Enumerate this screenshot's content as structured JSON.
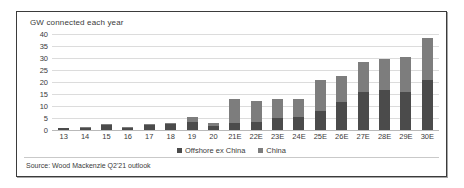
{
  "chart_data": {
    "type": "bar",
    "stacked": true,
    "title": "GW connected each year",
    "xlabel": "",
    "ylabel": "",
    "ylim": [
      0,
      40
    ],
    "yticks": [
      40,
      35,
      30,
      25,
      20,
      15,
      10,
      5,
      0
    ],
    "grid": true,
    "legend_position": "bottom-center",
    "categories": [
      "13",
      "14",
      "15",
      "16",
      "17",
      "18",
      "19",
      "20",
      "21E",
      "22E",
      "23E",
      "24E",
      "25E",
      "26E",
      "27E",
      "28E",
      "29E",
      "30E"
    ],
    "series": [
      {
        "name": "Offshore ex China",
        "color": "#4b4b4b",
        "values": [
          0.8,
          0.9,
          2.0,
          1.0,
          2.1,
          2.5,
          3.3,
          1.8,
          3.0,
          3.2,
          5.2,
          5.4,
          8.0,
          11.5,
          16.0,
          16.5,
          16.0,
          21.0
        ]
      },
      {
        "name": "China",
        "color": "#7d7d7d",
        "values": [
          0.2,
          0.2,
          0.4,
          0.2,
          0.3,
          0.6,
          2.0,
          1.0,
          10.0,
          8.8,
          7.8,
          7.6,
          13.0,
          11.0,
          12.5,
          13.0,
          14.5,
          17.5
        ]
      }
    ],
    "totals": [
      1.0,
      1.1,
      2.4,
      1.2,
      2.4,
      3.1,
      5.3,
      2.8,
      13.0,
      12.0,
      13.0,
      13.0,
      21.0,
      22.5,
      28.5,
      29.5,
      30.5,
      38.5
    ],
    "source": "Source: Wood Mackenzie Q2'21 outlook"
  }
}
